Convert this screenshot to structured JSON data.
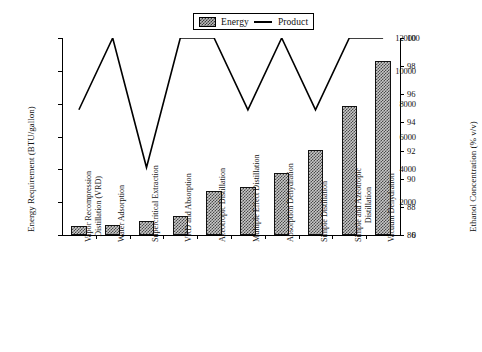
{
  "legend": {
    "items": [
      {
        "label": "Energy",
        "marker": "bar-swatch-icon"
      },
      {
        "label": "Product",
        "marker": "line-glyph-icon"
      }
    ]
  },
  "axes": {
    "left": {
      "title": "Energy Requirement (BTU/gallon)",
      "min": 0,
      "max": 12000,
      "ticks": [
        0,
        2000,
        4000,
        6000,
        8000,
        10000,
        12000
      ],
      "tick_labels": [
        "0",
        "2000",
        "4000",
        "6000",
        "8000",
        "10000",
        "12000"
      ]
    },
    "right": {
      "title": "Ethanol Concentration (% v/v)",
      "min": 86,
      "max": 100,
      "ticks": [
        86,
        88,
        90,
        92,
        94,
        96,
        98,
        100
      ],
      "tick_labels": [
        "86",
        "88",
        "90",
        "92",
        "94",
        "96",
        "98",
        "100"
      ]
    }
  },
  "chart_data": {
    "type": "bar",
    "title": "",
    "xlabel": "",
    "ylabel": "Energy Requirement (BTU/gallon)",
    "y2label": "Ethanol Concentration (% v/v)",
    "ylim": [
      0,
      12000
    ],
    "y2lim": [
      86,
      100
    ],
    "grid": false,
    "legend_position": "top-center",
    "categories": [
      "Vapor Recompression Distillation (VRD)",
      "Water Adsorption",
      "Supercritical Extraction",
      "VRD and Absorption",
      "Azeotropic Distillation",
      "Multiple Effect Distillation",
      "Absorption Dehydration",
      "Simple Distillation",
      "Simple and Azeotropic Distillation",
      "Vacuum Dehydration"
    ],
    "category_lines": [
      [
        "Vapor Recompression",
        "Distillation (VRD)"
      ],
      [
        "Water Adsorption"
      ],
      [
        "Supercritical Extraction"
      ],
      [
        "VRD and Absorption"
      ],
      [
        "Azeotropic Distillation"
      ],
      [
        "Multiple Effect Distillation"
      ],
      [
        "Absorption Dehydration"
      ],
      [
        "Simple Distillation"
      ],
      [
        "Simple and Azeotropic",
        "Distillation"
      ],
      [
        "Vacuum Dehydration"
      ]
    ],
    "series": [
      {
        "name": "Energy",
        "type": "bar",
        "axis": "left",
        "unit": "BTU/gallon",
        "values": [
          550,
          600,
          850,
          1150,
          2700,
          2900,
          3800,
          5200,
          7850,
          10600
        ]
      },
      {
        "name": "Product",
        "type": "line",
        "axis": "right",
        "unit": "% v/v",
        "values": [
          94.9,
          100,
          90.8,
          100,
          100,
          94.9,
          100,
          94.9,
          100,
          100
        ]
      }
    ]
  },
  "colors": {
    "axis": "#000000",
    "line": "#000000",
    "bar_fill": "#c8c8c8",
    "bar_hatch": "#4a4a4a",
    "bar_border": "#111111",
    "background": "#ffffff"
  }
}
